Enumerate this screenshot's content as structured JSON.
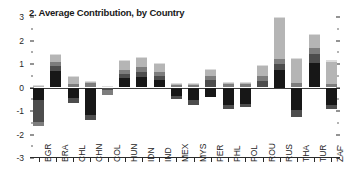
{
  "chart_data": {
    "type": "bar",
    "title": "2. Average Contribution, by Country",
    "xlabel": "",
    "ylabel": "",
    "ylim": [
      -3,
      3
    ],
    "yticks": [
      3,
      2,
      1,
      0,
      -1,
      -2,
      -3
    ],
    "ytick_labels": [
      "3",
      "2",
      "1",
      "0",
      "-1",
      "-2",
      "-3"
    ],
    "minor_ticks": true,
    "grid": false,
    "legend": "none",
    "stacked": true,
    "zero_line": true,
    "categories": [
      "BGR",
      "BRA",
      "CHL",
      "CHN",
      "COL",
      "HUN",
      "IDN",
      "IND",
      "MEX",
      "MYS",
      "PER",
      "PHL",
      "POL",
      "ROU",
      "RUS",
      "THA",
      "TUR",
      "ZAF"
    ],
    "segment_colors": [
      "#171717",
      "#4d4d4d",
      "#7d7d7d",
      "#b5b5b5",
      "#dcdcdc"
    ],
    "series": [
      {
        "name": "segment-1",
        "color": "#171717",
        "values": [
          -0.55,
          0.7,
          -0.45,
          -1.15,
          0.0,
          0.4,
          0.45,
          0.32,
          -0.35,
          -0.55,
          -0.42,
          -0.75,
          -0.7,
          0.0,
          0.75,
          -0.95,
          1.05,
          -0.75
        ]
      },
      {
        "name": "segment-2",
        "color": "#4d4d4d",
        "values": [
          -0.9,
          0.22,
          -0.22,
          -0.25,
          -0.12,
          0.18,
          0.2,
          0.15,
          -0.12,
          -0.18,
          0.3,
          -0.18,
          -0.12,
          0.28,
          0.25,
          -0.3,
          0.38,
          -0.18
        ]
      },
      {
        "name": "segment-3",
        "color": "#7d7d7d",
        "values": [
          -0.18,
          0.18,
          0.15,
          0.18,
          -0.18,
          0.15,
          0.22,
          0.18,
          0.12,
          0.12,
          0.18,
          0.15,
          0.15,
          0.2,
          0.22,
          0.2,
          0.25,
          0.15
        ]
      },
      {
        "name": "segment-4",
        "color": "#b5b5b5",
        "values": [
          0.05,
          0.3,
          0.32,
          0.05,
          0.05,
          0.42,
          0.38,
          0.35,
          0.05,
          0.06,
          0.28,
          0.05,
          0.06,
          0.45,
          1.75,
          1.0,
          0.55,
          0.95
        ]
      },
      {
        "name": "segment-5",
        "color": "#dcdcdc",
        "values": [
          0.04,
          0.04,
          0.04,
          0.04,
          0.03,
          0.04,
          0.04,
          0.04,
          0.03,
          0.03,
          0.04,
          0.03,
          0.03,
          0.04,
          0.05,
          0.05,
          0.05,
          0.05
        ]
      }
    ],
    "totals": [
      -1.54,
      1.44,
      -0.16,
      -1.13,
      -0.22,
      1.19,
      1.29,
      1.04,
      -0.27,
      -0.52,
      0.38,
      -0.7,
      -0.58,
      0.97,
      3.02,
      0.0,
      2.28,
      0.22
    ],
    "positive_tops": [
      0.09,
      1.44,
      0.51,
      0.27,
      0.08,
      1.19,
      1.29,
      1.04,
      0.2,
      0.21,
      0.8,
      0.23,
      0.24,
      0.97,
      3.02,
      1.25,
      2.28,
      1.15
    ],
    "negative_bottoms": [
      -1.63,
      0.0,
      -0.67,
      -1.4,
      -0.3,
      0.0,
      0.0,
      0.0,
      -0.47,
      -0.73,
      -0.42,
      -0.93,
      -0.82,
      0.0,
      0.0,
      -1.25,
      0.0,
      -0.93
    ]
  }
}
